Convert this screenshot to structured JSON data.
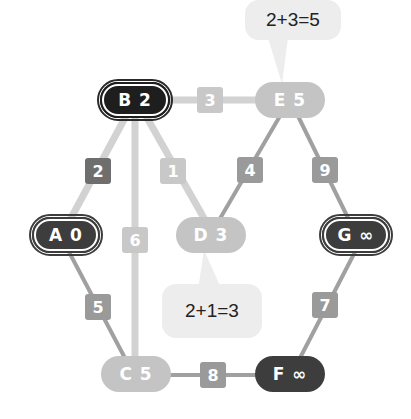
{
  "colors": {
    "light_node": "#c4c4c4",
    "dark_node": "#3d3d3d",
    "black_node": "#1e1e1e",
    "light_edge": "#d2d2d2",
    "mid_edge": "#a0a0a0",
    "bubble": "#ededed"
  },
  "nodes": [
    {
      "id": "B",
      "label": "B 2",
      "style": "black",
      "ring": true
    },
    {
      "id": "E",
      "label": "E 5",
      "style": "light",
      "ring": false
    },
    {
      "id": "A",
      "label": "A 0",
      "style": "dark",
      "ring": true
    },
    {
      "id": "D",
      "label": "D 3",
      "style": "light",
      "ring": false
    },
    {
      "id": "G",
      "label": "G ∞",
      "style": "dark",
      "ring": true
    },
    {
      "id": "C",
      "label": "C 5",
      "style": "light",
      "ring": false
    },
    {
      "id": "F",
      "label": "F ∞",
      "style": "dark",
      "ring": false
    }
  ],
  "edges": [
    {
      "from": "B",
      "to": "E",
      "weight": "3"
    },
    {
      "from": "B",
      "to": "A",
      "weight": "2"
    },
    {
      "from": "B",
      "to": "D",
      "weight": "1"
    },
    {
      "from": "B",
      "to": "C",
      "weight": "6"
    },
    {
      "from": "E",
      "to": "D",
      "weight": "4"
    },
    {
      "from": "E",
      "to": "G",
      "weight": "9"
    },
    {
      "from": "A",
      "to": "C",
      "weight": "5"
    },
    {
      "from": "G",
      "to": "F",
      "weight": "7"
    },
    {
      "from": "C",
      "to": "F",
      "weight": "8"
    }
  ],
  "bubbles": [
    {
      "target": "E",
      "text": "2+3=5"
    },
    {
      "target": "D",
      "text": "2+1=3"
    }
  ]
}
